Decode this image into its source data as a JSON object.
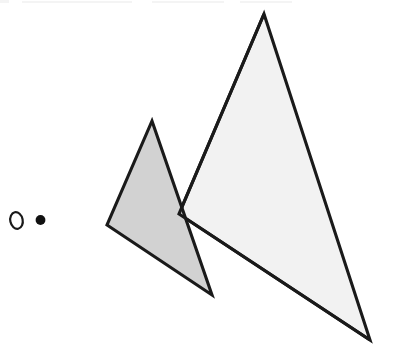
{
  "figure": {
    "canvas": {
      "width": 401,
      "height": 359,
      "background": "#ffffff"
    },
    "labels": {
      "origin_symbol": "O",
      "point_symbol": "•"
    },
    "colors": {
      "outline": "#1a1a1a",
      "small_triangle_fill": "#d2d2d2",
      "large_triangle_fill": "#f2f2f2",
      "dot_fill": "#111111",
      "background": "#ffffff",
      "artifact": "#f0f0f0"
    },
    "markers": [
      {
        "name": "origin-circle",
        "kind": "hollow-circle",
        "cx": 16.5,
        "cy": 220.5,
        "rx": 6.2,
        "ry": 8.4,
        "rotation": -12,
        "stroke_width": 2.2
      },
      {
        "name": "solid-point",
        "kind": "filled-dot",
        "cx": 40.5,
        "cy": 220.0,
        "r": 4.9
      }
    ],
    "shapes": [
      {
        "name": "small-triangle",
        "fill": "#d2d2d2",
        "stroke": "#1a1a1a",
        "stroke_width": 3.1,
        "points": "152,121 212,295 107,225",
        "vertices": [
          {
            "label": "apex",
            "x": 152,
            "y": 121
          },
          {
            "label": "bottom-right",
            "x": 212,
            "y": 295
          },
          {
            "label": "left",
            "x": 107,
            "y": 225
          }
        ]
      },
      {
        "name": "large-triangle",
        "fill": "#f2f2f2",
        "stroke": "#1a1a1a",
        "stroke_width": 3.1,
        "points": "264,14 370,340 179,214",
        "vertices": [
          {
            "label": "apex",
            "x": 264,
            "y": 14
          },
          {
            "label": "bottom-right",
            "x": 370,
            "y": 340
          },
          {
            "label": "left",
            "x": 179,
            "y": 214
          }
        ]
      }
    ],
    "artifacts": [
      {
        "name": "scan-artifact-a"
      },
      {
        "name": "scan-artifact-b"
      },
      {
        "name": "scan-artifact-c"
      },
      {
        "name": "scan-artifact-d"
      }
    ]
  }
}
